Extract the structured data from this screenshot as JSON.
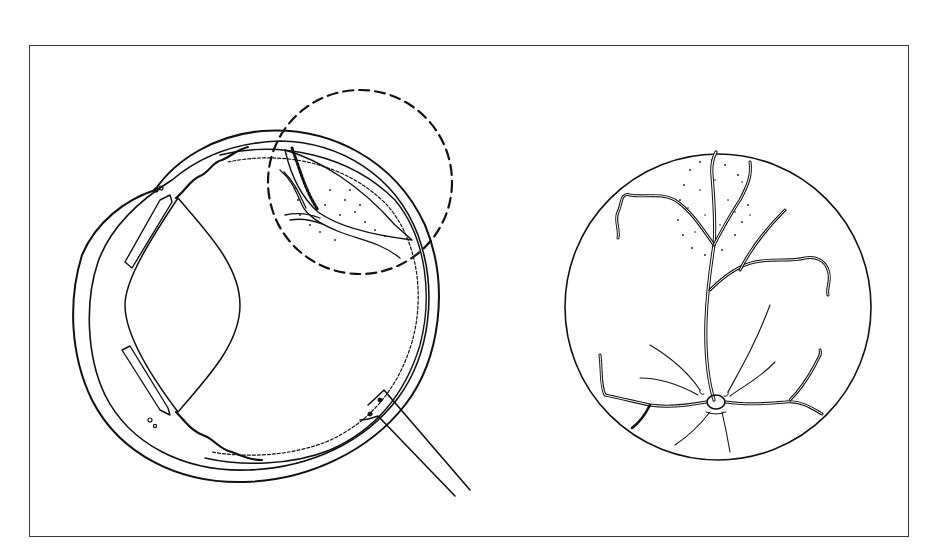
{
  "figure": {
    "type": "anatomical line illustration",
    "panels": [
      {
        "id": "cross-section",
        "description": "Sagittal cross-section of the eye with lens, ciliary body, retina, choroid, sclera and optic nerve; dashed magnification circle over a superior retinal lesion (stippled elevated mass with vessels)",
        "magnifier": {
          "style": "dashed circle",
          "cx": 360,
          "cy": 182,
          "r": 92
        }
      },
      {
        "id": "fundus-view",
        "description": "Circular fundus (ophthalmoscopic) view showing optic disc at bottom center with branching retinal vessels; a stippled oval lesion superiorly fed by a vessel",
        "circle": {
          "cx": 718,
          "cy": 307,
          "r": 153
        }
      }
    ]
  },
  "colors": {
    "ink": "#111111",
    "frame": "#3a3a3a",
    "background": "#ffffff"
  }
}
